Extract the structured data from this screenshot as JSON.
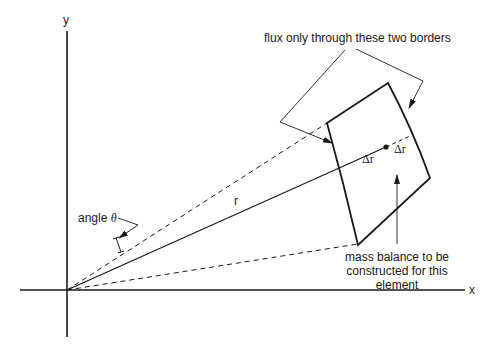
{
  "diagram": {
    "axes": {
      "x_label": "x",
      "y_label": "y"
    },
    "labels": {
      "flux_note": "flux only through these two borders",
      "radius": "r",
      "angle_prefix": "angle ",
      "angle_symbol": "θ",
      "delta_r_inner": "Δr",
      "delta_r_outer": "Δr",
      "mass_balance_line1": "mass balance to be",
      "mass_balance_line2": "constructed for this",
      "mass_balance_line3": "element"
    },
    "colors": {
      "stroke": "#1a1a1a",
      "background": "#ffffff"
    }
  }
}
